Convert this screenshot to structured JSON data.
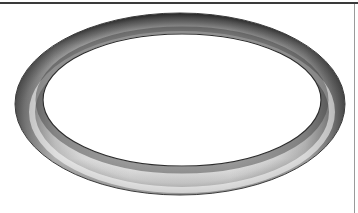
{
  "image": {
    "subject": "o-ring",
    "description": "3D rendered torus (O-ring) viewed in perspective on a white background",
    "colors": {
      "background": "#ffffff",
      "top_rule": "#3a3a3a",
      "right_rule": "#9a9a9a",
      "ring_light": "#f4f4f4",
      "ring_mid": "#a8a8a8",
      "ring_dark": "#3c3c3c"
    }
  }
}
